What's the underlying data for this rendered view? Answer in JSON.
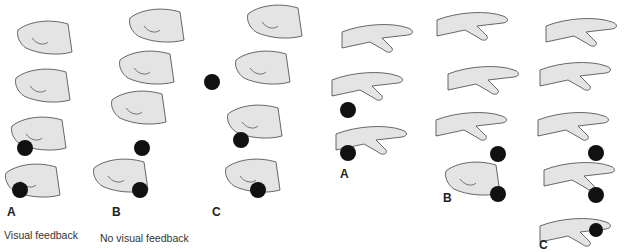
{
  "panels": [
    {
      "label": "A",
      "caption": "Visual feedback"
    },
    {
      "label": "B",
      "caption": "No visual feedback"
    },
    {
      "label": "C",
      "caption": ""
    },
    {
      "label": "A",
      "caption": ""
    },
    {
      "label": "B",
      "caption": ""
    },
    {
      "label": "C",
      "caption": ""
    }
  ],
  "colors": {
    "hand_fill": "#e4e4e4",
    "hand_stroke": "#444444",
    "ball": "#111111"
  }
}
